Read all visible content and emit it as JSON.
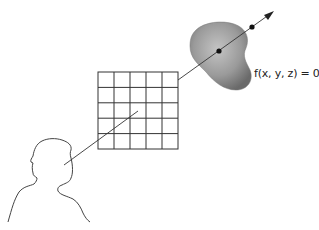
{
  "diagram": {
    "surface_label": "f(x, y, z) = 0",
    "grid": {
      "rows": 5,
      "cols": 5
    },
    "elements": [
      {
        "name": "viewer-head-silhouette",
        "description": "outline of person's head and shoulders (eye point)"
      },
      {
        "name": "image-plane-grid",
        "description": "5x5 pixel grid"
      },
      {
        "name": "implicit-surface-blob",
        "description": "gray shaded 3D blob"
      },
      {
        "name": "ray",
        "description": "line from eye through grid, through surface, ending in arrow"
      },
      {
        "name": "intersection-point-1",
        "description": "dot at ray entry into surface"
      },
      {
        "name": "intersection-point-2",
        "description": "dot at ray exit from surface"
      }
    ],
    "colors": {
      "line": "#333333",
      "blob_center": "#b8b8b8",
      "blob_edge": "#6e6e6e",
      "dot": "#111111"
    }
  }
}
